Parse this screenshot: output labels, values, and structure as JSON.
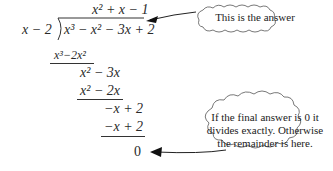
{
  "division": {
    "quotient": "x² + x − 1",
    "divisor": "x − 2",
    "dividend": "x³ − x² − 3x + 2",
    "steps": [
      {
        "subtract": "x³−2x²",
        "remainder": "x² − 3x"
      },
      {
        "subtract": "x² − 2x",
        "remainder": "−x + 2"
      },
      {
        "subtract": "−x + 2",
        "remainder": "0"
      }
    ]
  },
  "callouts": {
    "answer": "This is the answer",
    "remainder_lines": [
      "If the final answer is 0 it",
      "divides exactly. Otherwise",
      "the remainder is here."
    ]
  }
}
